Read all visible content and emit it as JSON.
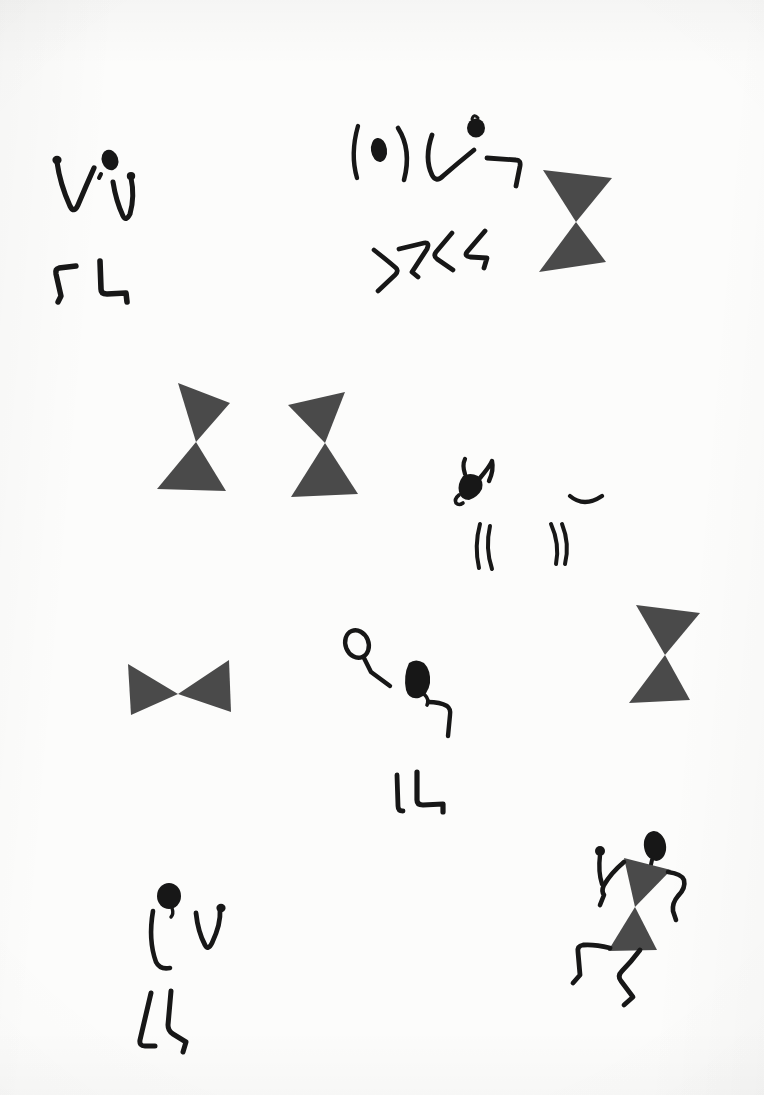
{
  "document": {
    "kind": "scanned-artwork-page",
    "title": "Warli tribal figure studies",
    "medium": "ink on paper",
    "page_width": 764,
    "page_height": 1095,
    "background_color": "#fcfcfb",
    "ink_color": "#171717",
    "solid_fill_color": "#4a4a4a"
  },
  "artwork": {
    "style": "Warli / pictograph stick figures",
    "motif_counts": {
      "hourglass_torsos": 6,
      "complete_figures": 3,
      "partial_figures": 5,
      "animal_heads": 1
    },
    "elements": [
      {
        "id": "fig-upper-left",
        "name": "partial-figure-upper-left",
        "description": "Blob head with two raised V-shaped arms and two angular legs, no torso",
        "x": 48,
        "y": 145,
        "width": 105,
        "height": 160
      },
      {
        "id": "fig-upper-center",
        "name": "partial-figure-upper-center",
        "description": "Two curved parenthesis arms flanking an oval head, bent arm, and zigzag legs",
        "x": 348,
        "y": 112,
        "width": 180,
        "height": 180
      },
      {
        "id": "torso-upper-right",
        "name": "hourglass-torso-upper-right",
        "description": "Solid dark hourglass torso, two triangles apex to apex",
        "x": 538,
        "y": 168,
        "width": 76,
        "height": 106
      },
      {
        "id": "torso-mid-left",
        "name": "hourglass-torso-mid-left",
        "description": "Solid dark hourglass torso",
        "x": 155,
        "y": 381,
        "width": 76,
        "height": 110
      },
      {
        "id": "torso-mid-center",
        "name": "hourglass-torso-mid-center",
        "description": "Solid dark hourglass torso",
        "x": 285,
        "y": 390,
        "width": 74,
        "height": 108
      },
      {
        "id": "animal-head",
        "name": "horned-animal-head",
        "description": "Horned bull or deer head in profile with curved strokes below",
        "x": 450,
        "y": 458,
        "width": 160,
        "height": 110
      },
      {
        "id": "torso-low-left",
        "name": "bowtie-torso-horizontal",
        "description": "Solid dark horizontal bowtie, two triangles meeting point to point",
        "x": 126,
        "y": 655,
        "width": 104,
        "height": 62
      },
      {
        "id": "fig-low-center",
        "name": "partial-figure-low-center",
        "description": "Open oval head on a stalk, filled blob head with bent arm, and two legs below",
        "x": 340,
        "y": 630,
        "width": 120,
        "height": 190
      },
      {
        "id": "torso-low-right",
        "name": "hourglass-torso-low-right",
        "description": "Solid dark hourglass torso at right margin",
        "x": 627,
        "y": 601,
        "width": 74,
        "height": 104
      },
      {
        "id": "fig-bottom-left",
        "name": "partial-figure-bottom-left",
        "description": "Round blob head, curved left arm, raised V right arm, two walking legs",
        "x": 130,
        "y": 875,
        "width": 110,
        "height": 180
      },
      {
        "id": "fig-bottom-right",
        "name": "dancing-figure-complete",
        "description": "Complete Warli dancer: blob head, solid hourglass torso, raised arms with fists and bent dancing legs",
        "x": 560,
        "y": 830,
        "width": 125,
        "height": 175
      }
    ]
  }
}
